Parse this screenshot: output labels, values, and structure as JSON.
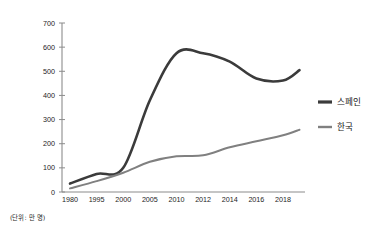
{
  "chart_data": {
    "type": "line",
    "title": "",
    "subtitle": "",
    "xlabel": "",
    "ylabel": "",
    "unit_note": "(단위: 만 명)",
    "categories": [
      "1980",
      "1995",
      "2000",
      "2005",
      "2010",
      "2012",
      "2014",
      "2016",
      "2018"
    ],
    "x_tick_labels": [
      "1980",
      "1995",
      "2000",
      "2005",
      "2010",
      "2012",
      "2014",
      "2016",
      "2018"
    ],
    "y_tick_labels": [
      "0",
      "100",
      "200",
      "300",
      "400",
      "500",
      "600",
      "700"
    ],
    "y_ticks": [
      0,
      100,
      200,
      300,
      400,
      500,
      600,
      700
    ],
    "ylim": [
      0,
      700
    ],
    "grid": false,
    "legend_position": "right",
    "series": [
      {
        "name": "스페인",
        "color": "#3b3b3b",
        "stroke_width": 2.6,
        "values": [
          35,
          75,
          100,
          380,
          575,
          575,
          540,
          470,
          462
        ],
        "end_value": 505,
        "end_label": "2019"
      },
      {
        "name": "한국",
        "color": "#808080",
        "stroke_width": 2.0,
        "values": [
          15,
          45,
          80,
          125,
          148,
          152,
          185,
          210,
          235
        ],
        "end_value": 258,
        "end_label": "2019"
      }
    ],
    "legend": [
      {
        "label": "스페인",
        "color": "#3b3b3b"
      },
      {
        "label": "한국",
        "color": "#808080"
      }
    ]
  },
  "axis": {
    "y_top_label": "700",
    "y_zero_label": "0"
  },
  "colors": {
    "background": "#ffffff",
    "axis": "#8c8c8c",
    "text": "#1a1a1a",
    "spain": "#3b3b3b",
    "korea": "#808080"
  }
}
